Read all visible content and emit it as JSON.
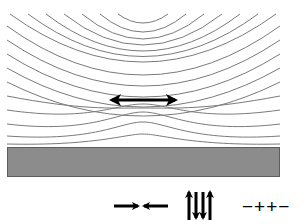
{
  "diagram": {
    "title": "",
    "colors": {
      "field_line": "#7a7a7a",
      "arrow": "#000000",
      "substrate_fill": "#8c8c8c",
      "substrate_stroke": "#5e5e5e",
      "background": "#ffffff"
    },
    "field_lines": [
      "M 118 14 Q 143 32 168 14",
      "M 100 14 Q 143 50 186 14",
      "M 82 14 Q 143 64 204 14",
      "M 64 14 Q 143 76 222 14",
      "M 46 14 Q 143 88 240 14",
      "M 28 14 Q 143 99 258 14",
      "M 10 14 Q 143 110 276 14",
      "M 7 26 Q 143 124 280 26",
      "M 7 40 Q 143 132 280 40",
      "M 7 54 Q 143 140 280 54",
      "M 7 68 Q 143 146 280 68",
      "M 7 82 Q 143 150 280 82",
      "M 7 96 C 80 110 110 108 143 108 C 176 108 206 110 280 96",
      "M 7 110 C 90 122 115 104 143 104 C 171 104 196 122 280 110",
      "M 7 124 C 90 134 118 112 143 112 C 168 112 196 134 280 124",
      "M 7 136 C 95 142 120 122 143 122 C 166 122 191 142 280 136",
      "M 7 144 C 95 146 125 134 143 134 C 161 134 191 146 280 144"
    ],
    "dipole_arrow": {
      "label": "in-plane magnetization",
      "x1": 111,
      "x2": 176,
      "y": 100
    },
    "substrate": {
      "label": "substrate",
      "x": 7,
      "y": 147,
      "width": 273,
      "height": 30
    },
    "legend": {
      "converging_arrows": "→←",
      "alternating_arrows": "↑↓↓↑",
      "charges": "−++−"
    }
  }
}
